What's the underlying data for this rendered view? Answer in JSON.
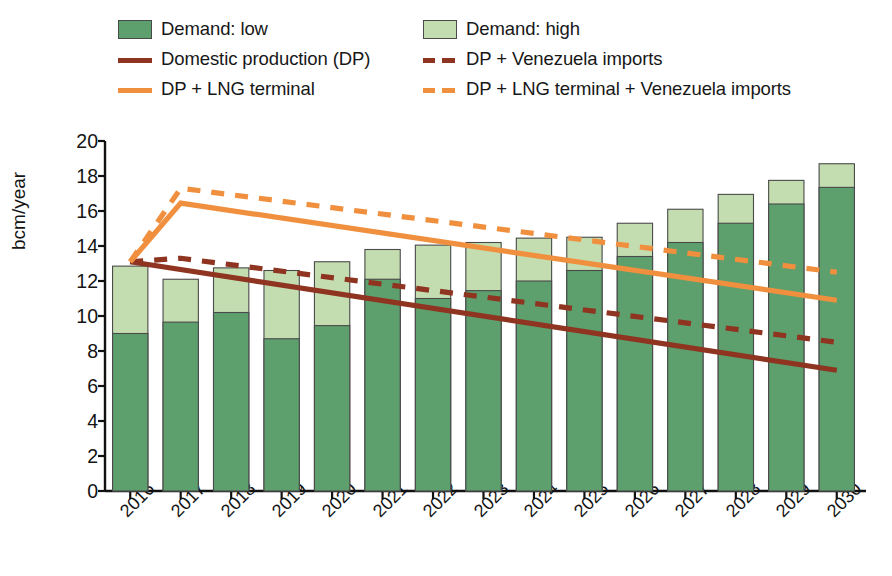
{
  "legend": {
    "rows": [
      [
        {
          "kind": "swatch-dark",
          "label": "Demand: low",
          "name": "legend-demand-low"
        },
        {
          "kind": "swatch-light",
          "label": "Demand: high",
          "name": "legend-demand-high"
        }
      ],
      [
        {
          "kind": "line-brown-solid",
          "label": "Domestic production (DP)",
          "name": "legend-domestic-production"
        },
        {
          "kind": "line-brown-dashed",
          "label": "DP + Venezuela imports",
          "name": "legend-dp-venezuela"
        }
      ],
      [
        {
          "kind": "line-orange-solid",
          "label": "DP + LNG terminal",
          "name": "legend-dp-lng"
        },
        {
          "kind": "line-orange-dashed",
          "label": "DP + LNG terminal + Venezuela imports",
          "name": "legend-dp-lng-venezuela"
        }
      ]
    ]
  },
  "colors": {
    "demand_low": "#5d9f6d",
    "demand_high": "#c3ddb0",
    "bar_outline": "#4a4a4a",
    "domestic_production": "#8e3420",
    "dp_venezuela": "#8e3420",
    "dp_lng": "#f0903f",
    "dp_lng_venezuela": "#f0903f",
    "axis": "#111111"
  },
  "chart_data": {
    "type": "bar",
    "title": "",
    "xlabel": "",
    "ylabel": "bcm/year",
    "ylim": [
      0,
      20
    ],
    "yticks": [
      0,
      2,
      4,
      6,
      8,
      10,
      12,
      14,
      16,
      18,
      20
    ],
    "grid": false,
    "legend_position": "top",
    "categories": [
      "2016",
      "2017",
      "2018",
      "2019",
      "2020",
      "2021",
      "2022",
      "2023",
      "2024",
      "2025",
      "2026",
      "2027",
      "2028",
      "2029",
      "2030"
    ],
    "series": [
      {
        "name": "Demand: low",
        "type": "bar-segment",
        "values": [
          9.0,
          9.65,
          10.2,
          8.7,
          9.45,
          12.1,
          11.0,
          11.45,
          12.0,
          12.6,
          13.4,
          14.2,
          15.3,
          16.4,
          17.35
        ]
      },
      {
        "name": "Demand: high",
        "type": "bar-total",
        "values": [
          12.85,
          12.1,
          12.75,
          12.6,
          13.1,
          13.8,
          14.05,
          14.2,
          14.45,
          14.5,
          15.3,
          16.1,
          16.95,
          17.75,
          18.7
        ]
      },
      {
        "name": "Domestic production (DP)",
        "type": "line",
        "style": "solid",
        "color": "#8e3420",
        "x": [
          "2016",
          "2030"
        ],
        "values": [
          13.1,
          6.9
        ]
      },
      {
        "name": "DP + Venezuela imports",
        "type": "line",
        "style": "dashed",
        "color": "#8e3420",
        "x": [
          "2016",
          "2017",
          "2030"
        ],
        "values": [
          13.1,
          13.3,
          8.5
        ]
      },
      {
        "name": "DP + LNG terminal",
        "type": "line",
        "style": "solid",
        "color": "#f0903f",
        "x": [
          "2016",
          "2017",
          "2030"
        ],
        "values": [
          13.1,
          16.45,
          10.9
        ]
      },
      {
        "name": "DP + LNG terminal + Venezuela imports",
        "type": "line",
        "style": "dashed",
        "color": "#f0903f",
        "x": [
          "2016",
          "2017",
          "2030"
        ],
        "values": [
          13.1,
          17.3,
          12.5
        ]
      }
    ]
  }
}
